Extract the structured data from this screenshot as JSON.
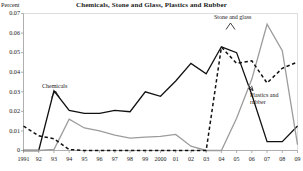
{
  "chart_data": {
    "type": "line",
    "title": "Chemicals, Stone and Glass, Plastics and Rubber",
    "ylabel": "Percent",
    "xlabel": "",
    "ylim": [
      0,
      0.07
    ],
    "grid": false,
    "legend_position": "inline-annotations",
    "ytick_labels": [
      "0.07",
      "0.06",
      "0.05",
      "0.04",
      "0.03",
      "0.02",
      "0.01",
      "0"
    ],
    "ytick_values": [
      0.07,
      0.06,
      0.05,
      0.04,
      0.03,
      0.02,
      0.01,
      0
    ],
    "categories": [
      "1991",
      "92",
      "93",
      "94",
      "95",
      "96",
      "97",
      "98",
      "99",
      "2000",
      "01",
      "02",
      "03",
      "04",
      "05",
      "06",
      "07",
      "08",
      "09"
    ],
    "x": [
      1991,
      1992,
      1993,
      1994,
      1995,
      1996,
      1997,
      1998,
      1999,
      2000,
      2001,
      2002,
      2003,
      2004,
      2005,
      2006,
      2007,
      2008,
      2009
    ],
    "series": [
      {
        "name": "Chemicals",
        "style": "solid",
        "color": "#111111",
        "values": [
          0,
          0,
          0.0305,
          0.0205,
          0.019,
          0.019,
          0.0205,
          0.0198,
          0.03,
          0.0277,
          0.0355,
          0.0445,
          0.0392,
          0.053,
          0.05,
          0.0285,
          0.0045,
          0.0045,
          0.0125
        ]
      },
      {
        "name": "Stone and glass",
        "style": "solid",
        "color": "#9c9c9c",
        "values": [
          0,
          0,
          0.0005,
          0.016,
          0.0115,
          0.01,
          0.0078,
          0.0063,
          0.0068,
          0.0072,
          0.0082,
          0.0022,
          0,
          0,
          0.0165,
          0.0365,
          0.0645,
          0.051,
          0.003
        ]
      },
      {
        "name": "Plastics and rubber",
        "style": "dashed",
        "color": "#111111",
        "values": [
          0.0125,
          0.0075,
          0.006,
          0.0005,
          0,
          0,
          0,
          0,
          0,
          0,
          0,
          0,
          0,
          0.0528,
          0.0445,
          0.0458,
          0.0345,
          0.042,
          0.0452
        ]
      }
    ],
    "annotations": [
      {
        "id": "chemicals",
        "text": "Chemicals",
        "x_px": 42,
        "y_px": 83
      },
      {
        "id": "stone-and-glass",
        "text": "Stone and glass",
        "x_px": 214,
        "y_px": 14
      },
      {
        "id": "plastics-and-rubber",
        "line1": "Plastics and",
        "line2": "rubber",
        "x_px": 250,
        "y_px": 92
      }
    ]
  }
}
